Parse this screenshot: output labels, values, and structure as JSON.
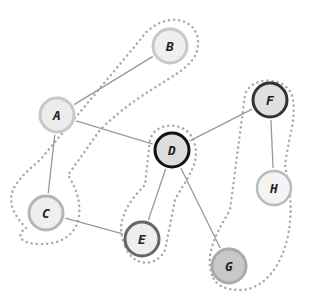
{
  "graph": {
    "nodes": [
      {
        "id": "A",
        "label": "A",
        "x": 57,
        "y": 115,
        "fill": "#ececec",
        "stroke": "#c8c8c8",
        "sw": 3
      },
      {
        "id": "B",
        "label": "B",
        "x": 170,
        "y": 46,
        "fill": "#efefef",
        "stroke": "#c8c8c8",
        "sw": 3
      },
      {
        "id": "C",
        "label": "C",
        "x": 46,
        "y": 213,
        "fill": "#efefef",
        "stroke": "#b5b5b5",
        "sw": 3
      },
      {
        "id": "D",
        "label": "D",
        "x": 172,
        "y": 150,
        "fill": "#dcdcdc",
        "stroke": "#111111",
        "sw": 3
      },
      {
        "id": "E",
        "label": "E",
        "x": 142,
        "y": 239,
        "fill": "#eeeeee",
        "stroke": "#666666",
        "sw": 3
      },
      {
        "id": "F",
        "label": "F",
        "x": 270,
        "y": 100,
        "fill": "#e0e0e0",
        "stroke": "#333333",
        "sw": 3
      },
      {
        "id": "G",
        "label": "G",
        "x": 229,
        "y": 266,
        "fill": "#c8c8c8",
        "stroke": "#aaaaaa",
        "sw": 3
      },
      {
        "id": "H",
        "label": "H",
        "x": 274,
        "y": 188,
        "fill": "#f4f4f4",
        "stroke": "#bbbbbb",
        "sw": 2.5
      }
    ],
    "edges": [
      [
        "A",
        "B"
      ],
      [
        "A",
        "D"
      ],
      [
        "A",
        "C"
      ],
      [
        "C",
        "E"
      ],
      [
        "D",
        "E"
      ],
      [
        "D",
        "F"
      ],
      [
        "D",
        "G"
      ],
      [
        "F",
        "H"
      ]
    ],
    "groups": [
      {
        "name": "A-B-C",
        "path": "M 26 228 C 0 200, 10 185, 40 160 L 140 40 C 160 10, 200 15, 198 45 C 196 75, 150 80, 100 130 L 68 175 C 90 210, 80 245, 40 244 C 20 244, 15 235, 26 228 Z"
      },
      {
        "name": "D-E",
        "path": "M 125 245 C 115 225, 125 205, 145 185 L 150 140 C 155 120, 190 120, 195 145 C 200 165, 185 180, 175 200 L 165 250 C 155 270, 130 265, 125 245 Z"
      },
      {
        "name": "F-G-H",
        "path": "M 212 275 C 205 255, 215 235, 230 210 L 245 95 C 250 75, 290 75, 293 100 C 296 120, 290 130, 285 165 L 290 195 C 295 250, 270 290, 240 290 C 225 290, 215 285, 212 275 Z"
      }
    ]
  }
}
